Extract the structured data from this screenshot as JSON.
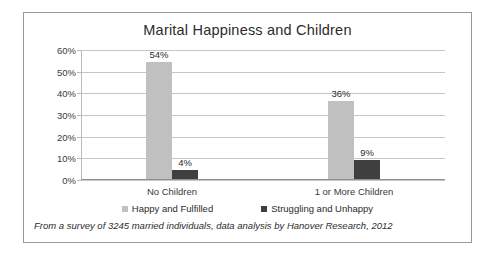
{
  "chart_data": {
    "type": "bar",
    "title": "Marital Happiness and Children",
    "xlabel": "",
    "ylabel": "",
    "categories": [
      "No Children",
      "1 or More Children"
    ],
    "series": [
      {
        "name": "Happy and Fulfilled",
        "color": "#c0c0c0",
        "values": [
          54,
          4
        ]
      },
      {
        "name": "Struggling and Unhappy",
        "color": "#3f3f3f",
        "values": [
          36,
          9
        ]
      }
    ],
    "note": "Series order per category is: Happy and Fulfilled then Struggling and Unhappy; values are 54% / 4% for No Children and 36% / 9% for 1 or More Children.",
    "groups": [
      {
        "category": "No Children",
        "bars": [
          {
            "series": "Happy and Fulfilled",
            "value": 54,
            "label": "54%"
          },
          {
            "series": "Struggling and Unhappy",
            "value": 4,
            "label": "4%"
          }
        ]
      },
      {
        "category": "1 or More Children",
        "bars": [
          {
            "series": "Happy and Fulfilled",
            "value": 36,
            "label": "36%"
          },
          {
            "series": "Struggling and Unhappy",
            "value": 9,
            "label": "9%"
          }
        ]
      }
    ],
    "ylim": [
      0,
      60
    ],
    "ytick_values": [
      60,
      50,
      40,
      30,
      20,
      10,
      0
    ],
    "ytick_labels": [
      "60%",
      "50%",
      "40%",
      "30%",
      "20%",
      "10%",
      "0%"
    ],
    "grid": true,
    "legend_position": "bottom"
  },
  "footnote": "From a survey of 3245 married individuals, data analysis by Hanover Research, 2012"
}
